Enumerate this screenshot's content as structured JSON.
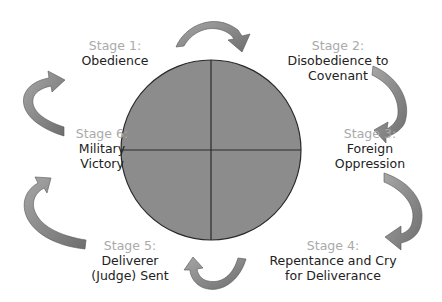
{
  "diagram": {
    "type": "cycle",
    "circle": {
      "fill": "#8c8c8c",
      "stroke": "#2a2a2a"
    },
    "arrow_color": "#7f7f7f",
    "stages": [
      {
        "stage": "Stage 1:",
        "name_lines": [
          "Obedience"
        ]
      },
      {
        "stage": "Stage 2:",
        "name_lines": [
          "Disobedience to",
          "Covenant"
        ]
      },
      {
        "stage": "Stage 3:",
        "name_lines": [
          "Foreign",
          "Oppression"
        ]
      },
      {
        "stage": "Stage 4:",
        "name_lines": [
          "Repentance and Cry",
          "for Deliverance"
        ]
      },
      {
        "stage": "Stage 5:",
        "name_lines": [
          "Deliverer",
          "(Judge) Sent"
        ]
      },
      {
        "stage": "Stage 6:",
        "name_lines": [
          "Military",
          "Victory"
        ]
      }
    ]
  }
}
